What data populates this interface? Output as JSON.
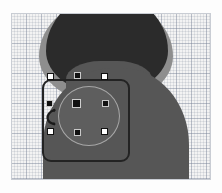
{
  "app": {
    "surface": "vector-graphics-canvas",
    "view": "object-selected"
  },
  "canvas": {
    "name": "graph-paper-canvas",
    "background_color": "#f3f3f3",
    "grid": {
      "minor_cell_px": 3,
      "major_cell_px": 15,
      "minor_color": "#969eac",
      "major_color": "#788296",
      "visible": true
    },
    "border_color": "#c9cdd4",
    "x": 11,
    "y": 13,
    "width": 200,
    "height": 167
  },
  "artwork": {
    "shapes": [
      {
        "name": "head-halo-shape",
        "fill": "#8e8e8e",
        "kind": "ellipse"
      },
      {
        "name": "head-dark-shape",
        "fill": "#2b2b2b",
        "kind": "ellipse"
      },
      {
        "name": "neck-shape",
        "fill": "#565656",
        "kind": "rounded-rect"
      },
      {
        "name": "body-shape",
        "fill": "#565656",
        "kind": "blob"
      }
    ]
  },
  "selection": {
    "name": "selected-ellipse-object",
    "shape_kind": "ellipse",
    "fill": "#5e5e5e",
    "stroke": "#a7a7a7",
    "bounding_box": {
      "stroke": "#232323",
      "corner_radius": 9,
      "x": 31,
      "y": 66,
      "width": 88,
      "height": 83
    },
    "handles": {
      "corner_style": "hollow-white-square",
      "cardinal_style": "filled-black-square",
      "center_style": "filled-black-square",
      "size_px": 7,
      "items": [
        {
          "name": "handle-top-left",
          "style": "hollow",
          "x": 47,
          "y": 73
        },
        {
          "name": "handle-top-right",
          "style": "hollow",
          "x": 101,
          "y": 73
        },
        {
          "name": "handle-bottom-left",
          "style": "hollow",
          "x": 47,
          "y": 128
        },
        {
          "name": "handle-bottom-right",
          "style": "hollow",
          "x": 101,
          "y": 128
        },
        {
          "name": "handle-top-center",
          "style": "filled",
          "x": 74,
          "y": 72
        },
        {
          "name": "handle-bottom-center",
          "style": "filled",
          "x": 74,
          "y": 129
        },
        {
          "name": "handle-middle-left",
          "style": "filled",
          "x": 46,
          "y": 100
        },
        {
          "name": "handle-middle-right",
          "style": "filled",
          "x": 102,
          "y": 100
        },
        {
          "name": "handle-center",
          "style": "center",
          "x": 73,
          "y": 99
        }
      ]
    },
    "rotate_handle": {
      "name": "rotate-handle",
      "glyph": "curved-rotate-arrow",
      "color": "#1b1b1b",
      "x": 33,
      "y": 95
    }
  }
}
